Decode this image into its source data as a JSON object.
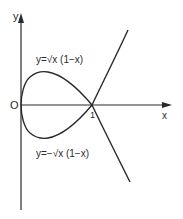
{
  "diagram": {
    "title": "",
    "axes": {
      "x_label": "x",
      "y_label": "y",
      "origin_label": "O",
      "x_tick_label": "1"
    },
    "curves": [
      {
        "name": "upper-branch",
        "label": "y=√x (1−x)"
      },
      {
        "name": "lower-branch",
        "label": "y=−√x (1−x)"
      }
    ],
    "colors": {
      "stroke": "#2a2a2a",
      "background": "#ffffff"
    }
  }
}
